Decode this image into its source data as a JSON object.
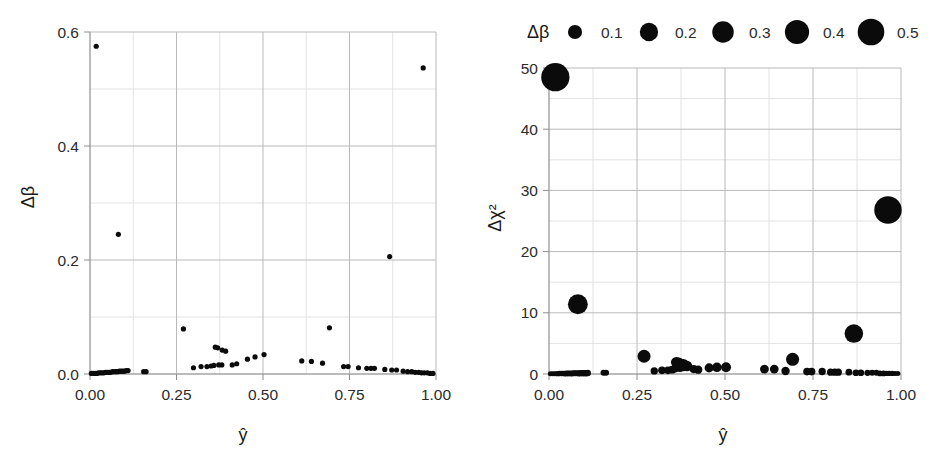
{
  "figure": {
    "background": "#ffffff",
    "marker_color": "#0b0b0b",
    "grid_major_color": "#b9b9b9",
    "grid_minor_color": "#e2e2e2"
  },
  "chart_data": [
    {
      "panel": "left",
      "type": "scatter",
      "title": "",
      "xlabel": "ŷ",
      "ylabel": "Δβ",
      "xlim": [
        0.0,
        1.0
      ],
      "ylim": [
        0.0,
        0.6
      ],
      "xticks": [
        0.0,
        0.25,
        0.5,
        0.75,
        1.0
      ],
      "xtick_labels": [
        "0.00",
        "0.25",
        "0.50",
        "0.75",
        "1.00"
      ],
      "yticks": [
        0.0,
        0.2,
        0.4,
        0.6
      ],
      "ytick_labels": [
        "0.0",
        "0.2",
        "0.4",
        "0.6"
      ],
      "yticks_minor": [
        0.1,
        0.3,
        0.5
      ],
      "xticks_minor": [
        0.125,
        0.375,
        0.625,
        0.875
      ],
      "grid": true,
      "legend": null,
      "points": [
        {
          "x": 0.018,
          "y": 0.575
        },
        {
          "x": 0.082,
          "y": 0.245
        },
        {
          "x": 0.866,
          "y": 0.206
        },
        {
          "x": 0.963,
          "y": 0.537
        },
        {
          "x": 0.27,
          "y": 0.079
        },
        {
          "x": 0.692,
          "y": 0.081
        },
        {
          "x": 0.362,
          "y": 0.047
        },
        {
          "x": 0.369,
          "y": 0.046
        },
        {
          "x": 0.382,
          "y": 0.042
        },
        {
          "x": 0.392,
          "y": 0.04
        },
        {
          "x": 0.455,
          "y": 0.026
        },
        {
          "x": 0.477,
          "y": 0.03
        },
        {
          "x": 0.503,
          "y": 0.034
        },
        {
          "x": 0.612,
          "y": 0.023
        },
        {
          "x": 0.64,
          "y": 0.022
        },
        {
          "x": 0.672,
          "y": 0.019
        },
        {
          "x": 0.299,
          "y": 0.011
        },
        {
          "x": 0.321,
          "y": 0.013
        },
        {
          "x": 0.338,
          "y": 0.013
        },
        {
          "x": 0.35,
          "y": 0.014
        },
        {
          "x": 0.358,
          "y": 0.015
        },
        {
          "x": 0.372,
          "y": 0.016
        },
        {
          "x": 0.381,
          "y": 0.016
        },
        {
          "x": 0.411,
          "y": 0.016
        },
        {
          "x": 0.424,
          "y": 0.018
        },
        {
          "x": 0.733,
          "y": 0.013
        },
        {
          "x": 0.746,
          "y": 0.013
        },
        {
          "x": 0.776,
          "y": 0.011
        },
        {
          "x": 0.8,
          "y": 0.01
        },
        {
          "x": 0.812,
          "y": 0.01
        },
        {
          "x": 0.822,
          "y": 0.01
        },
        {
          "x": 0.852,
          "y": 0.008
        },
        {
          "x": 0.872,
          "y": 0.007
        },
        {
          "x": 0.886,
          "y": 0.007
        },
        {
          "x": 0.905,
          "y": 0.005
        },
        {
          "x": 0.918,
          "y": 0.004
        },
        {
          "x": 0.93,
          "y": 0.004
        },
        {
          "x": 0.94,
          "y": 0.003
        },
        {
          "x": 0.95,
          "y": 0.003
        },
        {
          "x": 0.958,
          "y": 0.002
        },
        {
          "x": 0.966,
          "y": 0.002
        },
        {
          "x": 0.975,
          "y": 0.002
        },
        {
          "x": 0.983,
          "y": 0.001
        },
        {
          "x": 0.991,
          "y": 0.001
        },
        {
          "x": 0.155,
          "y": 0.004
        },
        {
          "x": 0.162,
          "y": 0.004
        },
        {
          "x": 0.004,
          "y": 0.001
        },
        {
          "x": 0.01,
          "y": 0.001
        },
        {
          "x": 0.015,
          "y": 0.001
        },
        {
          "x": 0.02,
          "y": 0.001
        },
        {
          "x": 0.025,
          "y": 0.002
        },
        {
          "x": 0.03,
          "y": 0.002
        },
        {
          "x": 0.035,
          "y": 0.002
        },
        {
          "x": 0.04,
          "y": 0.002
        },
        {
          "x": 0.045,
          "y": 0.003
        },
        {
          "x": 0.05,
          "y": 0.003
        },
        {
          "x": 0.055,
          "y": 0.003
        },
        {
          "x": 0.06,
          "y": 0.003
        },
        {
          "x": 0.065,
          "y": 0.004
        },
        {
          "x": 0.07,
          "y": 0.004
        },
        {
          "x": 0.075,
          "y": 0.004
        },
        {
          "x": 0.08,
          "y": 0.004
        },
        {
          "x": 0.085,
          "y": 0.005
        },
        {
          "x": 0.09,
          "y": 0.005
        },
        {
          "x": 0.095,
          "y": 0.005
        },
        {
          "x": 0.1,
          "y": 0.005
        },
        {
          "x": 0.105,
          "y": 0.006
        },
        {
          "x": 0.11,
          "y": 0.006
        }
      ]
    },
    {
      "panel": "right",
      "type": "scatter",
      "title": "",
      "xlabel": "ŷ",
      "ylabel": "Δχ²",
      "xlim": [
        0.0,
        1.0
      ],
      "ylim": [
        0.0,
        50.0
      ],
      "xticks": [
        0.0,
        0.25,
        0.5,
        0.75,
        1.0
      ],
      "xtick_labels": [
        "0.00",
        "0.25",
        "0.50",
        "0.75",
        "1.00"
      ],
      "yticks": [
        0,
        10,
        20,
        30,
        40,
        50
      ],
      "ytick_labels": [
        "0",
        "10",
        "20",
        "30",
        "40",
        "50"
      ],
      "yticks_minor": [
        5,
        15,
        25,
        35,
        45
      ],
      "xticks_minor": [
        0.125,
        0.375,
        0.625,
        0.875
      ],
      "grid": true,
      "size_encodes": "Δβ",
      "legend": {
        "title": "Δβ",
        "position": "above-plot",
        "entries": [
          {
            "label": "0.1",
            "size": 0.1
          },
          {
            "label": "0.2",
            "size": 0.2
          },
          {
            "label": "0.3",
            "size": 0.3
          },
          {
            "label": "0.4",
            "size": 0.4
          },
          {
            "label": "0.5",
            "size": 0.5
          }
        ]
      },
      "points": [
        {
          "x": 0.018,
          "y": 48.5,
          "s": 0.575
        },
        {
          "x": 0.082,
          "y": 11.4,
          "s": 0.245
        },
        {
          "x": 0.866,
          "y": 6.6,
          "s": 0.206
        },
        {
          "x": 0.963,
          "y": 26.8,
          "s": 0.537
        },
        {
          "x": 0.27,
          "y": 2.9,
          "s": 0.079
        },
        {
          "x": 0.692,
          "y": 2.4,
          "s": 0.081
        },
        {
          "x": 0.362,
          "y": 1.9,
          "s": 0.047
        },
        {
          "x": 0.369,
          "y": 1.8,
          "s": 0.046
        },
        {
          "x": 0.382,
          "y": 1.6,
          "s": 0.042
        },
        {
          "x": 0.392,
          "y": 1.3,
          "s": 0.04
        },
        {
          "x": 0.455,
          "y": 1.0,
          "s": 0.026
        },
        {
          "x": 0.477,
          "y": 1.1,
          "s": 0.03
        },
        {
          "x": 0.503,
          "y": 1.1,
          "s": 0.034
        },
        {
          "x": 0.612,
          "y": 0.8,
          "s": 0.023
        },
        {
          "x": 0.64,
          "y": 0.8,
          "s": 0.022
        },
        {
          "x": 0.672,
          "y": 0.5,
          "s": 0.019
        },
        {
          "x": 0.299,
          "y": 0.5,
          "s": 0.011
        },
        {
          "x": 0.321,
          "y": 0.6,
          "s": 0.013
        },
        {
          "x": 0.338,
          "y": 0.6,
          "s": 0.013
        },
        {
          "x": 0.35,
          "y": 0.7,
          "s": 0.014
        },
        {
          "x": 0.358,
          "y": 0.9,
          "s": 0.015
        },
        {
          "x": 0.372,
          "y": 1.0,
          "s": 0.016
        },
        {
          "x": 0.381,
          "y": 1.1,
          "s": 0.016
        },
        {
          "x": 0.411,
          "y": 0.8,
          "s": 0.016
        },
        {
          "x": 0.424,
          "y": 0.7,
          "s": 0.018
        },
        {
          "x": 0.733,
          "y": 0.4,
          "s": 0.013
        },
        {
          "x": 0.746,
          "y": 0.4,
          "s": 0.013
        },
        {
          "x": 0.776,
          "y": 0.4,
          "s": 0.011
        },
        {
          "x": 0.8,
          "y": 0.3,
          "s": 0.01
        },
        {
          "x": 0.812,
          "y": 0.3,
          "s": 0.01
        },
        {
          "x": 0.822,
          "y": 0.3,
          "s": 0.01
        },
        {
          "x": 0.852,
          "y": 0.3,
          "s": 0.008
        },
        {
          "x": 0.872,
          "y": 0.2,
          "s": 0.007
        },
        {
          "x": 0.886,
          "y": 0.2,
          "s": 0.007
        },
        {
          "x": 0.905,
          "y": 0.2,
          "s": 0.005
        },
        {
          "x": 0.918,
          "y": 0.2,
          "s": 0.004
        },
        {
          "x": 0.93,
          "y": 0.2,
          "s": 0.004
        },
        {
          "x": 0.94,
          "y": 0.1,
          "s": 0.003
        },
        {
          "x": 0.95,
          "y": 0.1,
          "s": 0.003
        },
        {
          "x": 0.958,
          "y": 0.1,
          "s": 0.002
        },
        {
          "x": 0.966,
          "y": 0.1,
          "s": 0.002
        },
        {
          "x": 0.975,
          "y": 0.1,
          "s": 0.002
        },
        {
          "x": 0.983,
          "y": 0.1,
          "s": 0.001
        },
        {
          "x": 0.991,
          "y": 0.1,
          "s": 0.001
        },
        {
          "x": 0.155,
          "y": 0.2,
          "s": 0.004
        },
        {
          "x": 0.162,
          "y": 0.2,
          "s": 0.004
        },
        {
          "x": 0.004,
          "y": 0.05,
          "s": 0.001
        },
        {
          "x": 0.01,
          "y": 0.05,
          "s": 0.001
        },
        {
          "x": 0.015,
          "y": 0.05,
          "s": 0.001
        },
        {
          "x": 0.02,
          "y": 0.06,
          "s": 0.001
        },
        {
          "x": 0.025,
          "y": 0.06,
          "s": 0.002
        },
        {
          "x": 0.03,
          "y": 0.07,
          "s": 0.002
        },
        {
          "x": 0.035,
          "y": 0.07,
          "s": 0.002
        },
        {
          "x": 0.04,
          "y": 0.08,
          "s": 0.002
        },
        {
          "x": 0.045,
          "y": 0.08,
          "s": 0.003
        },
        {
          "x": 0.05,
          "y": 0.09,
          "s": 0.003
        },
        {
          "x": 0.055,
          "y": 0.09,
          "s": 0.003
        },
        {
          "x": 0.06,
          "y": 0.1,
          "s": 0.003
        },
        {
          "x": 0.065,
          "y": 0.1,
          "s": 0.004
        },
        {
          "x": 0.07,
          "y": 0.11,
          "s": 0.004
        },
        {
          "x": 0.075,
          "y": 0.11,
          "s": 0.004
        },
        {
          "x": 0.08,
          "y": 0.12,
          "s": 0.004
        },
        {
          "x": 0.085,
          "y": 0.12,
          "s": 0.005
        },
        {
          "x": 0.09,
          "y": 0.13,
          "s": 0.005
        },
        {
          "x": 0.095,
          "y": 0.13,
          "s": 0.005
        },
        {
          "x": 0.1,
          "y": 0.14,
          "s": 0.005
        },
        {
          "x": 0.105,
          "y": 0.14,
          "s": 0.006
        },
        {
          "x": 0.11,
          "y": 0.15,
          "s": 0.006
        }
      ]
    }
  ]
}
